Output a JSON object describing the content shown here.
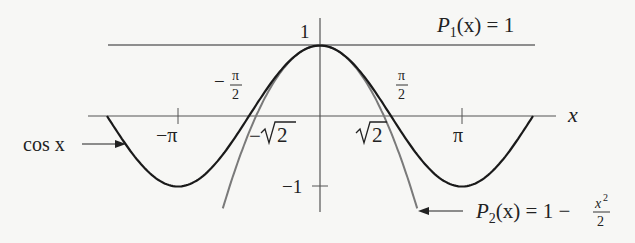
{
  "chart_data": {
    "type": "line",
    "title": "",
    "xlabel": "x",
    "ylabel": "",
    "xlim": [
      -5.0,
      5.1
    ],
    "ylim": [
      -1.35,
      1.4
    ],
    "grid": false,
    "legend": "inline annotations with arrows",
    "x_ticks": [
      {
        "value": -3.14159,
        "label": "−π"
      },
      {
        "value": 3.14159,
        "label": "π"
      }
    ],
    "y_ticks": [
      {
        "value": 1,
        "label": "1"
      },
      {
        "value": -1,
        "label": "−1"
      }
    ],
    "annotations": [
      {
        "text": "−π/2",
        "x": -1.5708,
        "note": "zero of cos x"
      },
      {
        "text": "π/2",
        "x": 1.5708,
        "note": "zero of cos x"
      },
      {
        "text": "−√2",
        "x": -1.4142,
        "note": "zero of P2"
      },
      {
        "text": "√2",
        "x": 1.4142,
        "note": "zero of P2"
      }
    ],
    "series": [
      {
        "name": "cos x",
        "label": "cos x",
        "color": "#1a1a1a",
        "domain": [
          -4.712,
          4.712
        ],
        "x": [
          -4.712,
          -3.927,
          -3.142,
          -2.356,
          -1.571,
          -0.785,
          0,
          0.785,
          1.571,
          2.356,
          3.142,
          3.927,
          4.712
        ],
        "y": [
          0,
          -0.707,
          -1,
          -0.707,
          0,
          0.707,
          1,
          0.707,
          0,
          -0.707,
          -1,
          -0.707,
          0
        ]
      },
      {
        "name": "P1(x) = 1",
        "label": "P₁(x) = 1",
        "color": "#6b6b6b",
        "domain": [
          -4.7,
          4.75
        ],
        "x": [
          -4.7,
          4.75
        ],
        "y": [
          1,
          1
        ]
      },
      {
        "name": "P2(x) = 1 − x²/2",
        "label": "P₂(x) = 1 − x²/2",
        "color": "#7a7a7a",
        "domain": [
          -2.15,
          2.15
        ],
        "x": [
          -2.15,
          -1.5,
          -1.414,
          -1,
          -0.5,
          0,
          0.5,
          1,
          1.414,
          1.5,
          2.15
        ],
        "y": [
          -1.311,
          -0.125,
          0,
          0.5,
          0.875,
          1,
          0.875,
          0.5,
          0,
          -0.125,
          -1.311
        ]
      }
    ]
  },
  "labels": {
    "y_one": "1",
    "y_neg_one": "−1",
    "x_axis": "x",
    "neg_pi": "−π",
    "pi": "π",
    "neg_half_pi_sign": "−",
    "pi_symbol": "π",
    "two": "2",
    "neg_sqrt2_sign": "−",
    "sqrt2_radicand": "2",
    "cos_label": "cos x",
    "p1_P": "P",
    "p1_sub": "1",
    "p1_rest": "(x) = 1",
    "p2_P": "P",
    "p2_sub": "2",
    "p2_rest": "(x) = 1 −",
    "p2_num": "x",
    "p2_num_sup": "2",
    "p2_den": "2"
  }
}
